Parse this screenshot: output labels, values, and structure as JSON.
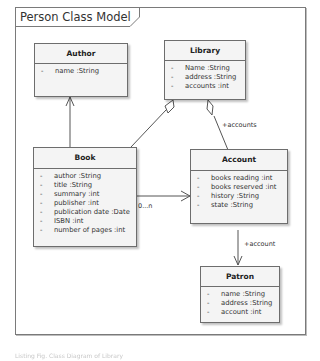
{
  "diagram": {
    "title": "Person Class Model",
    "classes": {
      "author": {
        "name": "Author",
        "attributes": [
          {
            "visibility": "-",
            "text": "name  :String"
          }
        ]
      },
      "library": {
        "name": "Library",
        "attributes": [
          {
            "visibility": "-",
            "text": "Name  :String"
          },
          {
            "visibility": "-",
            "text": "address  :String"
          },
          {
            "visibility": "-",
            "text": "accounts  :int"
          }
        ]
      },
      "book": {
        "name": "Book",
        "attributes": [
          {
            "visibility": "-",
            "text": "author  :String"
          },
          {
            "visibility": "-",
            "text": "title  :String"
          },
          {
            "visibility": "-",
            "text": "summary  :int"
          },
          {
            "visibility": "-",
            "text": "publisher  :int"
          },
          {
            "visibility": "-",
            "text": "publication date  :Date"
          },
          {
            "visibility": "-",
            "text": "ISBN  :int"
          },
          {
            "visibility": "-",
            "text": "number of pages  :int"
          }
        ]
      },
      "account": {
        "name": "Account",
        "attributes": [
          {
            "visibility": "-",
            "text": "books reading  :int"
          },
          {
            "visibility": "-",
            "text": "books reserved  :int"
          },
          {
            "visibility": "-",
            "text": "history  :String"
          },
          {
            "visibility": "-",
            "text": "state  :String"
          }
        ]
      },
      "patron": {
        "name": "Patron",
        "attributes": [
          {
            "visibility": "-",
            "text": "name  :String"
          },
          {
            "visibility": "-",
            "text": "address  :String"
          },
          {
            "visibility": "-",
            "text": "account  :int"
          }
        ]
      }
    },
    "relationships": [
      {
        "from": "Book",
        "to": "Author",
        "type": "navigable-association"
      },
      {
        "from": "Book",
        "to": "Library",
        "type": "aggregation"
      },
      {
        "from": "Account",
        "to": "Library",
        "type": "aggregation",
        "label": "+accounts"
      },
      {
        "from": "Book",
        "to": "Account",
        "type": "navigable-association",
        "label": "0...n"
      },
      {
        "from": "Account",
        "to": "Patron",
        "type": "navigable-association",
        "label": "+account"
      }
    ],
    "labels": {
      "accounts_role": "+accounts",
      "book_account_mult": "0...n",
      "account_role": "+account"
    },
    "colors": {
      "class_fill": "#f4f4f4",
      "class_border": "#6d6d6d",
      "line": "#555555"
    }
  },
  "footer": {
    "text": "Listing Fig. Class Diagram of Library"
  }
}
